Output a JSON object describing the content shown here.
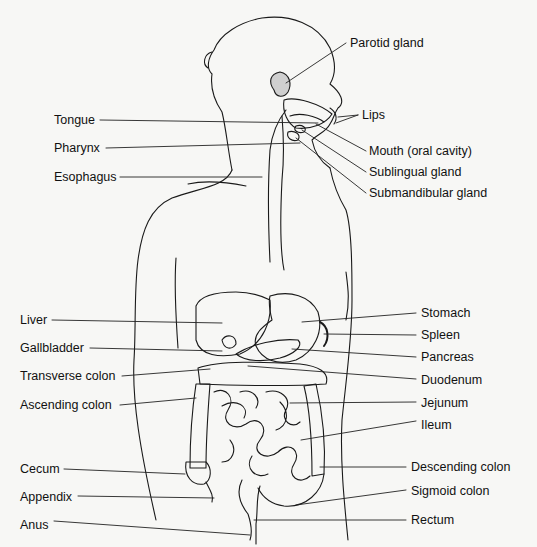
{
  "diagram": {
    "colors": {
      "background": "#f7f7f5",
      "ink": "#111111"
    },
    "labels_left": [
      {
        "id": "tongue",
        "text": "Tongue",
        "x": 54,
        "y": 113,
        "lx1": 100,
        "ly1": 120,
        "lx2": 318,
        "ly2": 123
      },
      {
        "id": "pharynx",
        "text": "Pharynx",
        "x": 54,
        "y": 141,
        "lx1": 106,
        "ly1": 148,
        "lx2": 300,
        "ly2": 143
      },
      {
        "id": "esophagus",
        "text": "Esophagus",
        "x": 54,
        "y": 170,
        "lx1": 120,
        "ly1": 177,
        "lx2": 262,
        "ly2": 177
      },
      {
        "id": "liver",
        "text": "Liver",
        "x": 20,
        "y": 313,
        "lx1": 52,
        "ly1": 320,
        "lx2": 222,
        "ly2": 323
      },
      {
        "id": "gallbladder",
        "text": "Gallbladder",
        "x": 20,
        "y": 341,
        "lx1": 90,
        "ly1": 348,
        "lx2": 222,
        "ly2": 351
      },
      {
        "id": "transverse-colon",
        "text": "Transverse colon",
        "x": 20,
        "y": 369,
        "lx1": 122,
        "ly1": 376,
        "lx2": 210,
        "ly2": 369
      },
      {
        "id": "ascending-colon",
        "text": "Ascending colon",
        "x": 20,
        "y": 398,
        "lx1": 120,
        "ly1": 405,
        "lx2": 196,
        "ly2": 398
      },
      {
        "id": "cecum",
        "text": "Cecum",
        "x": 20,
        "y": 462,
        "lx1": 64,
        "ly1": 469,
        "lx2": 185,
        "ly2": 474
      },
      {
        "id": "appendix",
        "text": "Appendix",
        "x": 20,
        "y": 490,
        "lx1": 78,
        "ly1": 496,
        "lx2": 214,
        "ly2": 498
      },
      {
        "id": "anus",
        "text": "Anus",
        "x": 20,
        "y": 518,
        "lx1": 54,
        "ly1": 521,
        "lx2": 250,
        "ly2": 535
      }
    ],
    "labels_right": [
      {
        "id": "parotid-gland",
        "text": "Parotid gland",
        "x": 350,
        "y": 36,
        "lx1": 346,
        "ly1": 43,
        "lx2": 286,
        "ly2": 83
      },
      {
        "id": "lips",
        "text": "Lips",
        "x": 362,
        "y": 108,
        "lx1": 358,
        "ly1": 115,
        "lx2": 338,
        "ly2": 117
      },
      {
        "id": "mouth-oral-cavity",
        "text": "Mouth (oral cavity)",
        "x": 369,
        "y": 144,
        "lx1": 366,
        "ly1": 151,
        "lx2": 316,
        "ly2": 124
      },
      {
        "id": "sublingual-gland",
        "text": "Sublingual gland",
        "x": 369,
        "y": 165,
        "lx1": 366,
        "ly1": 172,
        "lx2": 302,
        "ly2": 130
      },
      {
        "id": "submandibular-gland",
        "text": "Submandibular gland",
        "x": 369,
        "y": 186,
        "lx1": 366,
        "ly1": 193,
        "lx2": 296,
        "ly2": 138
      },
      {
        "id": "stomach",
        "text": "Stomach",
        "x": 421,
        "y": 306,
        "lx1": 416,
        "ly1": 313,
        "lx2": 302,
        "ly2": 322
      },
      {
        "id": "spleen",
        "text": "Spleen",
        "x": 421,
        "y": 328,
        "lx1": 416,
        "ly1": 335,
        "lx2": 324,
        "ly2": 334
      },
      {
        "id": "pancreas",
        "text": "Pancreas",
        "x": 421,
        "y": 350,
        "lx1": 416,
        "ly1": 357,
        "lx2": 292,
        "ly2": 349
      },
      {
        "id": "duodenum",
        "text": "Duodenum",
        "x": 421,
        "y": 373,
        "lx1": 416,
        "ly1": 379,
        "lx2": 248,
        "ly2": 366
      },
      {
        "id": "jejunum",
        "text": "Jejunum",
        "x": 421,
        "y": 396,
        "lx1": 416,
        "ly1": 402,
        "lx2": 290,
        "ly2": 403
      },
      {
        "id": "ileum",
        "text": "Ileum",
        "x": 421,
        "y": 418,
        "lx1": 416,
        "ly1": 421,
        "lx2": 301,
        "ly2": 440
      },
      {
        "id": "descending-colon",
        "text": "Descending colon",
        "x": 411,
        "y": 460,
        "lx1": 406,
        "ly1": 467,
        "lx2": 320,
        "ly2": 467
      },
      {
        "id": "sigmoid-colon",
        "text": "Sigmoid colon",
        "x": 411,
        "y": 484,
        "lx1": 406,
        "ly1": 490,
        "lx2": 296,
        "ly2": 505
      },
      {
        "id": "rectum",
        "text": "Rectum",
        "x": 411,
        "y": 513,
        "lx1": 406,
        "ly1": 520,
        "lx2": 254,
        "ly2": 520
      }
    ]
  }
}
